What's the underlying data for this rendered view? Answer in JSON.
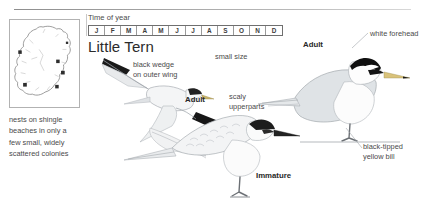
{
  "species": {
    "title": "Little Tern"
  },
  "time_of_year": {
    "label": "Time of year",
    "months": [
      "J",
      "F",
      "M",
      "A",
      "M",
      "J",
      "J",
      "A",
      "S",
      "O",
      "N",
      "D"
    ]
  },
  "map": {
    "caption_lines": [
      "nests on shingle",
      "beaches in only a",
      "few small, widely",
      "scattered colonies"
    ]
  },
  "annotations": {
    "black_wedge_line1": "black wedge",
    "black_wedge_line2": "on outer wing",
    "small_size": "small size",
    "scaly_line1": "scaly",
    "scaly_line2": "upperparts",
    "white_forehead": "white forehead",
    "bill_line1": "black-tipped",
    "bill_line2": "yellow bill",
    "adult_flying": "Adult",
    "adult_standing": "Adult",
    "immature": "Immature"
  },
  "colors": {
    "ink": "#3a3a3a",
    "black": "#111111",
    "grey_body": "#c9ccd1",
    "bill_yellow": "#d9c27a",
    "panel_border": "#b2b2b2"
  }
}
